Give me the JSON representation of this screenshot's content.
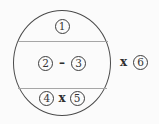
{
  "diagram": {
    "colors": {
      "background": "#fbfbfb",
      "circle_stroke": "#4a4a4a",
      "divider": "#a6a6a6",
      "text": "#333333"
    },
    "circle": {
      "top_section": {
        "number1": "1"
      },
      "middle_section": {
        "number2": "2",
        "operator": "–",
        "number3": "3"
      },
      "bottom_section": {
        "number4": "4",
        "operator": "x",
        "number5": "5"
      }
    },
    "outside": {
      "operator": "x",
      "number6": "6"
    }
  }
}
